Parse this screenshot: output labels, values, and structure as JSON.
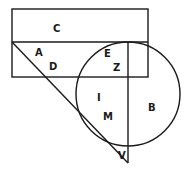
{
  "diagram": {
    "type": "venn-like region diagram",
    "colors": {
      "stroke": "#1a1a1a",
      "background": "#ffffff"
    },
    "shapes": {
      "outer_rectangle": {
        "x": 12,
        "y": 9,
        "w": 136,
        "h": 68
      },
      "inner_divider_y": 42,
      "inner_rectangle": {
        "x": 12,
        "y": 42,
        "w": 116,
        "h": 35
      },
      "circle": {
        "cx": 128,
        "cy": 94,
        "r": 52
      },
      "triangle": {
        "points": [
          [
            12,
            42
          ],
          [
            128,
            42
          ],
          [
            128,
            163
          ]
        ]
      }
    },
    "labels": {
      "C": "C",
      "A": "A",
      "D": "D",
      "E": "E",
      "Z": "Z",
      "I": "I",
      "M": "M",
      "B": "B",
      "V": "V"
    }
  }
}
